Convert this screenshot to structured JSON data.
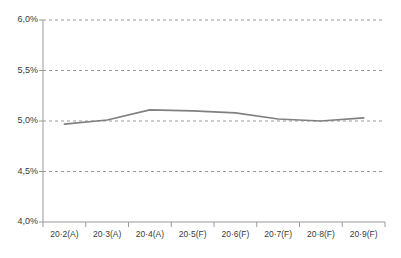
{
  "chart_data": {
    "type": "line",
    "title": "",
    "subtitle": "",
    "xlabel": "",
    "ylabel": "",
    "categories": [
      "20·2(A)",
      "20·3(A)",
      "20·4(A)",
      "20·5(F)",
      "20·6(F)",
      "20·7(F)",
      "20·8(F)",
      "20·9(F)"
    ],
    "values": [
      4.97,
      5.01,
      5.11,
      5.1,
      5.08,
      5.02,
      5.0,
      5.03
    ],
    "value_unit": "%",
    "ylim": [
      4.0,
      6.0
    ],
    "ytick_values": [
      4.0,
      4.5,
      5.0,
      5.5,
      6.0
    ],
    "ytick_labels": [
      "4,0%",
      "4,5%",
      "5,0%",
      "5,5%",
      "6,0%"
    ],
    "grid": true,
    "grid_style": "dashed",
    "grid_axis": "y",
    "legend": false,
    "legend_position": "none",
    "series": [
      {
        "name": "",
        "values": [
          4.97,
          5.01,
          5.11,
          5.1,
          5.08,
          5.02,
          5.0,
          5.03
        ]
      }
    ],
    "annotations": []
  },
  "colors": {
    "background": "#ffffff",
    "line": "#808080",
    "grid": "#999999",
    "axis": "#9a9a9a",
    "tick_text": "#3a3a3a"
  }
}
